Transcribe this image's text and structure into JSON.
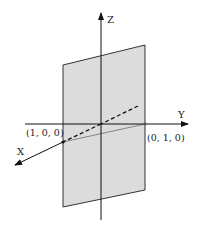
{
  "diagram": {
    "axes": {
      "x_label": "X",
      "y_label": "Y",
      "z_label": "Z"
    },
    "points": [
      {
        "label": "(1, 0, 0)"
      },
      {
        "label": "(0, 1, 0)"
      }
    ],
    "colors": {
      "plane_fill": "#dcdcdc",
      "plane_stroke": "#333333",
      "axis": "#111111",
      "trace_line": "#888888"
    }
  }
}
